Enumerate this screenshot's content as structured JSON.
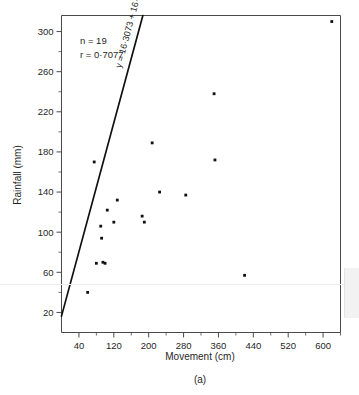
{
  "figure": {
    "caption": "(a)",
    "background": "#ffffff"
  },
  "chart_data": {
    "type": "scatter",
    "title": "",
    "xlabel": "Movement (cm)",
    "ylabel": "Rainfall (mm)",
    "xlim": [
      0,
      640
    ],
    "ylim": [
      0,
      316
    ],
    "xticks": [
      40,
      120,
      200,
      280,
      360,
      440,
      520,
      600
    ],
    "xtick_labels": [
      "40",
      "120",
      "200",
      "280",
      "360",
      "440",
      "520",
      "600"
    ],
    "xtick_minor": [
      80,
      160,
      240,
      320,
      400,
      480,
      560,
      640
    ],
    "yticks": [
      20,
      60,
      100,
      140,
      180,
      220,
      260,
      300
    ],
    "ytick_labels": [
      "20",
      "60",
      "100",
      "140",
      "180",
      "220",
      "260",
      "300"
    ],
    "ytick_minor": [
      40,
      80,
      120,
      160,
      200,
      240,
      280
    ],
    "grid": false,
    "legend": false,
    "marker": "square",
    "marker_color": "#111111",
    "line_color": "#111111",
    "points": [
      {
        "x": 60,
        "y": 40
      },
      {
        "x": 80,
        "y": 69
      },
      {
        "x": 95,
        "y": 70
      },
      {
        "x": 100,
        "y": 69
      },
      {
        "x": 90,
        "y": 106
      },
      {
        "x": 92,
        "y": 94
      },
      {
        "x": 120,
        "y": 110
      },
      {
        "x": 128,
        "y": 132
      },
      {
        "x": 75,
        "y": 170
      },
      {
        "x": 185,
        "y": 116
      },
      {
        "x": 190,
        "y": 110
      },
      {
        "x": 208,
        "y": 189
      },
      {
        "x": 225,
        "y": 140
      },
      {
        "x": 285,
        "y": 137
      },
      {
        "x": 352,
        "y": 172
      },
      {
        "x": 350,
        "y": 238
      },
      {
        "x": 420,
        "y": 57
      },
      {
        "x": 620,
        "y": 310
      },
      {
        "x": 105,
        "y": 122
      }
    ],
    "fit": {
      "label": "y = 16·3073 + 16·0553x",
      "intercept": 16.3073,
      "slope": 16.0553,
      "slope_units": "mm per 10 cm",
      "x_start": 0,
      "x_end": 505
    },
    "annotations": {
      "n_label": "n = 19",
      "r_label": "r = 0·7077",
      "n": 19,
      "r": 0.7077
    }
  }
}
